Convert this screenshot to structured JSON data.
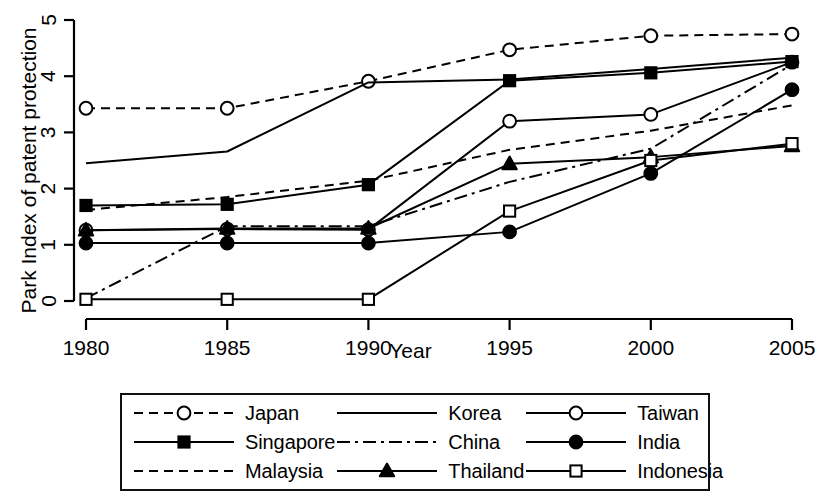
{
  "chart_data": {
    "type": "line",
    "title": "",
    "xlabel": "Year",
    "ylabel": "Park Index of patent protection",
    "x": [
      1980,
      1985,
      1990,
      1995,
      2000,
      2005
    ],
    "xticklabels": [
      "1980",
      "1985",
      "1990",
      "1995",
      "2000",
      "2005"
    ],
    "yticklabels": [
      "0",
      "1",
      "2",
      "3",
      "4",
      "5"
    ],
    "xlim": [
      1978.5,
      2006.5
    ],
    "ylim": [
      0,
      5
    ],
    "grid": false,
    "legend_position": "below-plot",
    "series": [
      {
        "name": "Japan",
        "values": [
          3.43,
          3.43,
          3.91,
          4.47,
          4.72,
          4.75
        ],
        "line_style": "dashed",
        "marker": "open-circle",
        "color": "#000000"
      },
      {
        "name": "Korea",
        "values": [
          2.45,
          2.66,
          3.89,
          3.94,
          4.13,
          4.33
        ],
        "line_style": "solid",
        "marker": "none",
        "color": "#000000"
      },
      {
        "name": "Taiwan",
        "values": [
          1.26,
          1.28,
          1.27,
          3.2,
          3.32,
          4.25
        ],
        "line_style": "solid",
        "marker": "open-circle",
        "color": "#000000"
      },
      {
        "name": "Singapore",
        "values": [
          1.7,
          1.72,
          2.07,
          3.92,
          4.06,
          4.26
        ],
        "line_style": "solid",
        "marker": "filled-square",
        "color": "#000000"
      },
      {
        "name": "China",
        "values": [
          0.05,
          1.33,
          1.33,
          2.12,
          2.71,
          4.21
        ],
        "line_style": "dash-dot",
        "marker": "none",
        "color": "#000000"
      },
      {
        "name": "India",
        "values": [
          1.03,
          1.03,
          1.03,
          1.23,
          2.27,
          3.76
        ],
        "line_style": "solid",
        "marker": "filled-circle",
        "color": "#000000"
      },
      {
        "name": "Malaysia",
        "values": [
          1.62,
          1.85,
          2.14,
          2.69,
          3.03,
          3.48
        ],
        "line_style": "dashed",
        "marker": "none",
        "color": "#000000"
      },
      {
        "name": "Thailand",
        "values": [
          1.26,
          1.29,
          1.29,
          2.44,
          2.56,
          2.76
        ],
        "line_style": "solid",
        "marker": "filled-triangle",
        "color": "#000000"
      },
      {
        "name": "Indonesia",
        "values": [
          0.03,
          0.03,
          0.03,
          1.6,
          2.5,
          2.8
        ],
        "line_style": "solid",
        "marker": "open-square",
        "color": "#000000"
      }
    ]
  },
  "axes": {
    "xlabel": "Year",
    "ylabel": "Park Index of patent protection"
  },
  "legend": {
    "entries": [
      {
        "label": "Japan",
        "line_style": "dashed",
        "marker": "open-circle"
      },
      {
        "label": "Korea",
        "line_style": "solid",
        "marker": "none"
      },
      {
        "label": "Taiwan",
        "line_style": "solid",
        "marker": "open-circle"
      },
      {
        "label": "Singapore",
        "line_style": "solid",
        "marker": "filled-square"
      },
      {
        "label": "China",
        "line_style": "dash-dot",
        "marker": "none"
      },
      {
        "label": "India",
        "line_style": "solid",
        "marker": "filled-circle"
      },
      {
        "label": "Malaysia",
        "line_style": "dashed",
        "marker": "none"
      },
      {
        "label": "Thailand",
        "line_style": "solid",
        "marker": "filled-triangle"
      },
      {
        "label": "Indonesia",
        "line_style": "solid",
        "marker": "open-square"
      }
    ]
  }
}
